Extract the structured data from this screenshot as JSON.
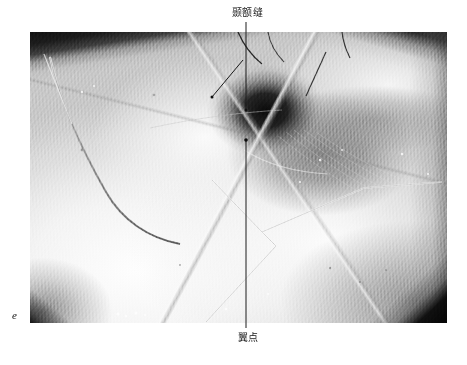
{
  "figure": {
    "letter": "e",
    "type": "anatomical-photograph"
  },
  "annotations": [
    {
      "id": "sphenofrontal-suture",
      "label": "颞额缝",
      "position": "top",
      "leader_lines": [
        {
          "from": [
            246,
            22
          ],
          "to": [
            246,
            110
          ],
          "type": "vertical"
        },
        {
          "from": [
            243,
            60
          ],
          "to": [
            212,
            97
          ],
          "type": "diagonal"
        }
      ]
    },
    {
      "id": "pterion",
      "label": "翼点",
      "position": "bottom",
      "leader_lines": [
        {
          "from": [
            246,
            328
          ],
          "to": [
            246,
            140
          ],
          "type": "vertical"
        }
      ]
    }
  ],
  "photo": {
    "left": 30,
    "top": 32,
    "width": 417,
    "height": 291,
    "border_color": "#ffffff"
  },
  "colors": {
    "background": "#ffffff",
    "label_text": "#1a1a1a",
    "leader_line": "#1c1c1c",
    "bone_highlight": "#f8f8f8",
    "muscle_midtone": "#707070",
    "cavity_shadow": "#080808"
  }
}
